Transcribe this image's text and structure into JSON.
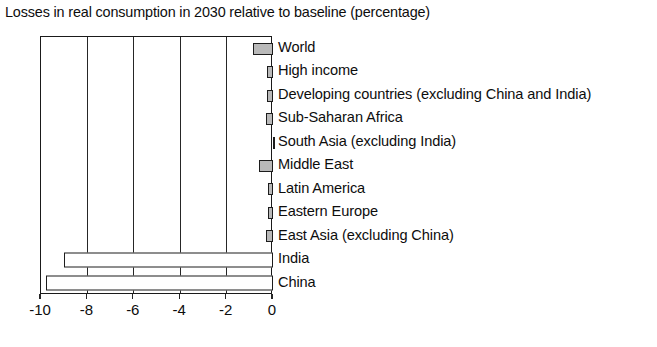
{
  "chart_data": {
    "type": "bar",
    "orientation": "horizontal",
    "title": "Losses in real consumption in 2030 relative to baseline (percentage)",
    "xlabel": "",
    "ylabel": "",
    "xlim": [
      -10,
      0
    ],
    "xticks": [
      -10,
      -8,
      -6,
      -4,
      -2,
      0
    ],
    "xticklabels": [
      "-10",
      "-8",
      "-6",
      "-4",
      "-2",
      "0"
    ],
    "grid": true,
    "grid_axis": "x",
    "legend": "none",
    "categories": [
      "World",
      "High income",
      "Developing countries (excluding China and India)",
      "Sub-Saharan Africa",
      "South Asia (excluding India)",
      "Middle East",
      "Latin America",
      "Eastern Europe",
      "East Asia (excluding China)",
      "India",
      "China"
    ],
    "values": [
      -0.85,
      -0.25,
      -0.25,
      -0.3,
      -0.02,
      -0.6,
      -0.2,
      -0.2,
      -0.3,
      -9.0,
      -9.8
    ],
    "bar_styles": [
      "filled",
      "filled",
      "filled",
      "filled",
      "filled",
      "filled",
      "filled",
      "filled",
      "filled",
      "hollow",
      "hollow"
    ],
    "colors": {
      "bar_fill": "#b9b9b9",
      "bar_hollow_fill": "#ffffff",
      "bar_outline": "#1c1c1c",
      "axis": "#1a1a1a",
      "grid": "#262626",
      "text": "#0d0d0d",
      "background": "#ffffff"
    }
  }
}
